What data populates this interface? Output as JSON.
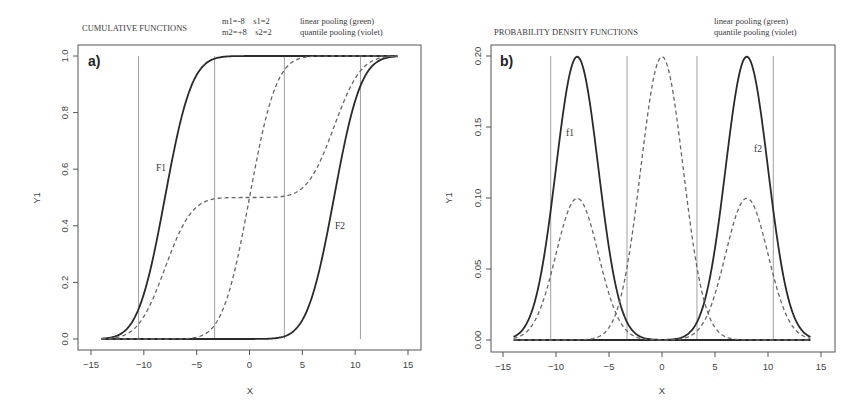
{
  "panel_a": {
    "header_title": "CUMULATIVE FUNCTIONS",
    "params_line1": "m1=-8    s1=2",
    "params_line2": "m2=+8    s2=2",
    "legend_line1": "linear pooling (green)",
    "legend_line2": "quantile pooling (violet)",
    "tag": "a)",
    "xlabel": "X",
    "ylabel": "Y1",
    "label_F1": "F1",
    "label_F2": "F2"
  },
  "panel_b": {
    "header_title": "PROBABILITY DENSITY FUNCTIONS",
    "legend_line1": "linear pooling (green)",
    "legend_line2": "quantile pooling (violet)",
    "tag": "b)",
    "xlabel": "X",
    "ylabel": "Y1",
    "label_f1": "f1",
    "label_f2": "f2"
  },
  "chart_data": [
    {
      "type": "line",
      "title": "CUMULATIVE FUNCTIONS",
      "panel": "a)",
      "xlabel": "X",
      "ylabel": "Y1",
      "xlim": [
        -15,
        15
      ],
      "ylim": [
        0,
        1
      ],
      "xticks": [
        "-15",
        "-10",
        "-5",
        "0",
        "5",
        "10",
        "15"
      ],
      "yticks": [
        "0.0",
        "0.2",
        "0.4",
        "0.6",
        "0.8",
        "1.0"
      ],
      "grid": false,
      "vertical_lines_x": [
        -10.5,
        -3.3,
        3.3,
        10.5
      ],
      "annotations": [
        "m1=-8  s1=2",
        "m2=+8  s2=2",
        "linear pooling (green)",
        "quantile pooling (violet)",
        "F1",
        "F2"
      ],
      "series": [
        {
          "name": "F1",
          "style": "solid",
          "kind": "normal_cdf",
          "mean": -8,
          "sd": 2
        },
        {
          "name": "F2",
          "style": "solid",
          "kind": "normal_cdf",
          "mean": 8,
          "sd": 2
        },
        {
          "name": "linear pooling",
          "style": "dashed",
          "kind": "mixture_cdf",
          "means": [
            -8,
            8
          ],
          "sd": 2,
          "weights": [
            0.5,
            0.5
          ]
        },
        {
          "name": "quantile pooling",
          "style": "dashed",
          "kind": "normal_cdf",
          "mean": 0,
          "sd": 2
        }
      ],
      "sample_points": {
        "x": [
          -15,
          -12,
          -10,
          -8,
          -6,
          -4,
          -2,
          0,
          2,
          4,
          6,
          8,
          10,
          12,
          15
        ],
        "F1": [
          0.0,
          0.02,
          0.16,
          0.5,
          0.84,
          0.98,
          1.0,
          1.0,
          1.0,
          1.0,
          1.0,
          1.0,
          1.0,
          1.0,
          1.0
        ],
        "F2": [
          0.0,
          0.0,
          0.0,
          0.0,
          0.0,
          0.0,
          0.0,
          0.0,
          0.0,
          0.02,
          0.16,
          0.5,
          0.84,
          0.98,
          1.0
        ],
        "linear_pooling": [
          0.0,
          0.01,
          0.08,
          0.25,
          0.42,
          0.49,
          0.5,
          0.5,
          0.5,
          0.51,
          0.58,
          0.75,
          0.92,
          0.99,
          1.0
        ],
        "quantile_pooling": [
          0.0,
          0.0,
          0.0,
          0.0,
          0.0,
          0.02,
          0.16,
          0.5,
          0.84,
          0.98,
          1.0,
          1.0,
          1.0,
          1.0,
          1.0
        ]
      }
    },
    {
      "type": "line",
      "title": "PROBABILITY DENSITY FUNCTIONS",
      "panel": "b)",
      "xlabel": "X",
      "ylabel": "Y1",
      "xlim": [
        -15,
        15
      ],
      "ylim": [
        0,
        0.2
      ],
      "xticks": [
        "-15",
        "-10",
        "-5",
        "0",
        "5",
        "10",
        "15"
      ],
      "yticks": [
        "0.00",
        "0.05",
        "0.10",
        "0.15",
        "0.20"
      ],
      "grid": false,
      "vertical_lines_x": [
        -10.5,
        -3.3,
        3.3,
        10.5
      ],
      "annotations": [
        "linear pooling (green)",
        "quantile pooling (violet)",
        "f1",
        "f2"
      ],
      "series": [
        {
          "name": "f1",
          "style": "solid",
          "kind": "normal_pdf",
          "mean": -8,
          "sd": 2
        },
        {
          "name": "f2",
          "style": "solid",
          "kind": "normal_pdf",
          "mean": 8,
          "sd": 2
        },
        {
          "name": "linear pooling",
          "style": "dashed",
          "kind": "mixture_pdf",
          "means": [
            -8,
            8
          ],
          "sd": 2,
          "weights": [
            0.5,
            0.5
          ]
        },
        {
          "name": "quantile pooling",
          "style": "dashed",
          "kind": "normal_pdf",
          "mean": 0,
          "sd": 2
        }
      ],
      "sample_points": {
        "x": [
          -15,
          -12,
          -10,
          -8,
          -6,
          -4,
          -2,
          0,
          2,
          4,
          6,
          8,
          10,
          12,
          15
        ],
        "f1": [
          0.0,
          0.027,
          0.121,
          0.199,
          0.121,
          0.027,
          0.002,
          0.0,
          0.0,
          0.0,
          0.0,
          0.0,
          0.0,
          0.0,
          0.0
        ],
        "f2": [
          0.0,
          0.0,
          0.0,
          0.0,
          0.0,
          0.0,
          0.0,
          0.0,
          0.002,
          0.027,
          0.121,
          0.199,
          0.121,
          0.027,
          0.0
        ],
        "linear_pooling": [
          0.0,
          0.013,
          0.06,
          0.1,
          0.06,
          0.013,
          0.001,
          0.0,
          0.001,
          0.013,
          0.06,
          0.1,
          0.06,
          0.013,
          0.0
        ],
        "quantile_pooling": [
          0.0,
          0.0,
          0.0,
          0.0,
          0.0,
          0.027,
          0.121,
          0.199,
          0.121,
          0.027,
          0.0,
          0.0,
          0.0,
          0.0,
          0.0
        ]
      }
    }
  ]
}
